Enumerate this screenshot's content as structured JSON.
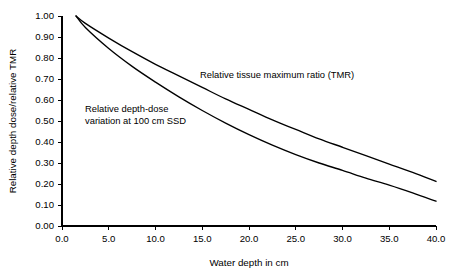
{
  "chart_data": {
    "type": "line",
    "title": "",
    "xlabel": "Water depth in cm",
    "ylabel": "Relative depth dose/relative TMR",
    "xlim": [
      0.0,
      40.0
    ],
    "ylim": [
      0.0,
      1.0
    ],
    "grid": false,
    "legend_position": "inline-annotations",
    "xticks": [
      "0.0",
      "5.0",
      "10.0",
      "15.0",
      "20.0",
      "25.0",
      "30.0",
      "35.0",
      "40.0"
    ],
    "xtick_values": [
      0.0,
      5.0,
      10.0,
      15.0,
      20.0,
      25.0,
      30.0,
      35.0,
      40.0
    ],
    "yticks": [
      "0.00",
      "0.10",
      "0.20",
      "0.30",
      "0.40",
      "0.50",
      "0.60",
      "0.70",
      "0.80",
      "0.90",
      "1.00"
    ],
    "ytick_values": [
      0.0,
      0.1,
      0.2,
      0.3,
      0.4,
      0.5,
      0.6,
      0.7,
      0.8,
      0.9,
      1.0
    ],
    "x": [
      1.5,
      2.5,
      5.0,
      7.5,
      10.0,
      12.5,
      15.0,
      17.5,
      20.0,
      22.5,
      25.0,
      27.5,
      30.0,
      32.5,
      35.0,
      37.5,
      40.0
    ],
    "series": [
      {
        "name": "Relative tissue maximum ratio (TMR)",
        "values": [
          1.0,
          0.965,
          0.895,
          0.83,
          0.77,
          0.715,
          0.66,
          0.605,
          0.555,
          0.505,
          0.46,
          0.415,
          0.375,
          0.335,
          0.295,
          0.255,
          0.212
        ]
      },
      {
        "name": "Relative depth-dose variation at 100 cm SSD",
        "values": [
          1.0,
          0.945,
          0.845,
          0.76,
          0.685,
          0.615,
          0.55,
          0.49,
          0.435,
          0.385,
          0.34,
          0.3,
          0.265,
          0.228,
          0.195,
          0.158,
          0.118
        ]
      }
    ],
    "annotations": [
      {
        "name": "tmr-label",
        "text": "Relative tissue maximum ratio (TMR)",
        "lines": [
          "Relative tissue maximum ratio (TMR)"
        ],
        "x_px": 200,
        "y_px": 78
      },
      {
        "name": "ssd-label",
        "text": "Relative depth-dose variation at 100 cm SSD",
        "lines": [
          "Relative depth-dose",
          "variation at 100 cm SSD"
        ],
        "x_px": 85,
        "y_px": 112
      }
    ],
    "colors": {
      "axis": "#000000",
      "curve": "#000000",
      "background": "#ffffff"
    }
  }
}
